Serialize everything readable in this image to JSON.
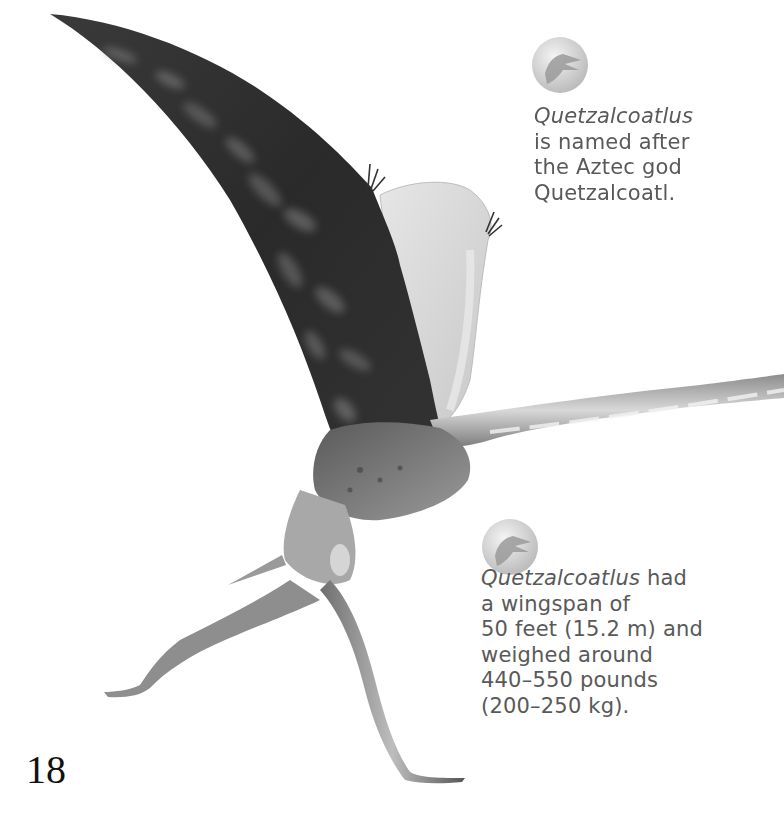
{
  "page": {
    "number": "18",
    "background": "#ffffff"
  },
  "illustration": {
    "subject": "Quetzalcoatlus pterosaur illustration",
    "colors": {
      "wing_dark": "#2e2e2e",
      "wing_mottle": "#7a7a7a",
      "membrane_light": "#d9d9d9",
      "body": "#6b6b6b",
      "limb": "#8a8a8a"
    }
  },
  "facts": [
    {
      "icon": "quetzalcoatlus-head-badge-icon",
      "lines": [
        {
          "italic": "Quetzalcoatlus",
          "text": ""
        },
        {
          "italic": "",
          "text": "is named after"
        },
        {
          "italic": "",
          "text": "the Aztec god"
        },
        {
          "italic": "",
          "text": "Quetzalcoatl."
        }
      ]
    },
    {
      "icon": "quetzalcoatlus-head-badge-icon",
      "lines": [
        {
          "italic": "Quetzalcoatlus",
          "text": " had"
        },
        {
          "italic": "",
          "text": "a wingspan of"
        },
        {
          "italic": "",
          "text": "50 feet (15.2 m) and"
        },
        {
          "italic": "",
          "text": "weighed around"
        },
        {
          "italic": "",
          "text": "440–550 pounds"
        },
        {
          "italic": "",
          "text": "(200–250 kg)."
        }
      ]
    }
  ],
  "text_color": "#595959"
}
